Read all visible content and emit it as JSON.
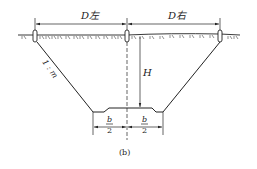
{
  "diagram": {
    "caption": "(b)",
    "labels": {
      "d_left": "D左",
      "d_right": "D右",
      "height": "H",
      "slope": "1 : m",
      "half_width_numerator": "b",
      "half_width_denominator": "2"
    },
    "colors": {
      "line": "#222222",
      "background": "#ffffff"
    }
  }
}
